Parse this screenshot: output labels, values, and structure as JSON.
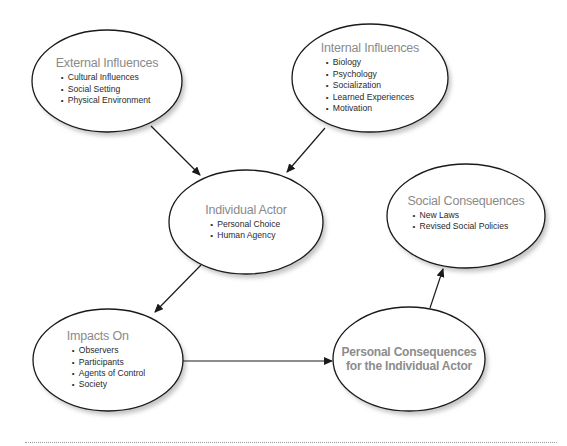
{
  "diagram": {
    "nodes": {
      "external_influences": {
        "title": "External Influences",
        "items": [
          "Cultural Influences",
          "Social Setting",
          "Physical Environment"
        ]
      },
      "internal_influences": {
        "title": "Internal Influences",
        "items": [
          "Biology",
          "Psychology",
          "Socialization",
          "Learned Experiences",
          "Motivation"
        ]
      },
      "individual_actor": {
        "title": "Individual Actor",
        "items": [
          "Personal Choice",
          "Human Agency"
        ]
      },
      "social_consequences": {
        "title": "Social Consequences",
        "items": [
          "New Laws",
          "Revised Social Policies"
        ]
      },
      "impacts_on": {
        "title": "Impacts On",
        "items": [
          "Observers",
          "Participants",
          "Agents of Control",
          "Society"
        ]
      },
      "personal_consequences": {
        "title_line1": "Personal Consequences",
        "title_line2": "for the Individual Actor"
      }
    },
    "edges": [
      {
        "from": "External Influences",
        "to": "Individual Actor"
      },
      {
        "from": "Internal Influences",
        "to": "Individual Actor"
      },
      {
        "from": "Individual Actor",
        "to": "Impacts On"
      },
      {
        "from": "Impacts On",
        "to": "Personal Consequences for the Individual Actor"
      },
      {
        "from": "Personal Consequences for the Individual Actor",
        "to": "Social Consequences"
      }
    ],
    "colors": {
      "title_text": "#8a8a8a",
      "body_text": "#2a2a2a",
      "stroke": "#1a1a1a",
      "shadow": "#c8c8c8"
    }
  }
}
